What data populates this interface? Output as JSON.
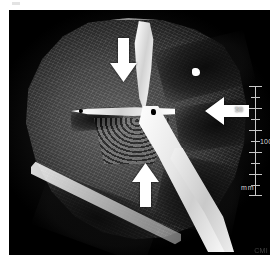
{
  "figure": {
    "modality": "CT",
    "view": "axial oblique cross-section of limb",
    "watermark": "CMI",
    "top_speck_label": "scan-residue-mark"
  },
  "ruler": {
    "label_50": "50",
    "label_100": "100",
    "units": "mm",
    "tick_count": 11
  },
  "annotations": [
    {
      "id": "arrow-down",
      "name": "annotation-arrow-down",
      "direction": "down",
      "points_to": "upper bone fragment / cortical disruption"
    },
    {
      "id": "arrow-left",
      "name": "annotation-arrow-left",
      "direction": "left",
      "points_to": "low-density gas or fluid collection"
    },
    {
      "id": "arrow-up",
      "name": "annotation-arrow-up",
      "direction": "up",
      "points_to": "soft-tissue plane below bone"
    }
  ]
}
